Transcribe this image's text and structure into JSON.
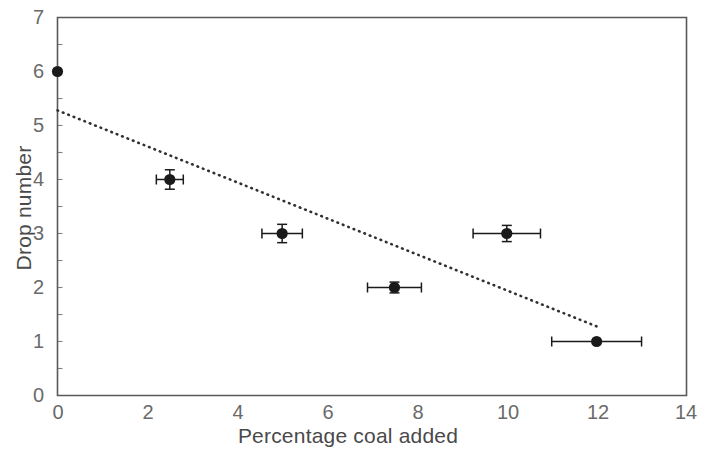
{
  "chart_data": {
    "type": "scatter",
    "title": "",
    "xlabel": "Percentage coal added",
    "ylabel": "Drop number",
    "xlim": [
      0,
      14
    ],
    "ylim": [
      0,
      7
    ],
    "xticks": [
      0,
      2,
      4,
      6,
      8,
      10,
      12,
      14
    ],
    "yticks": [
      0,
      1,
      2,
      3,
      4,
      5,
      6,
      7
    ],
    "xtick_labels": [
      "0",
      "2",
      "4",
      "6",
      "8",
      "10",
      "12",
      "14"
    ],
    "ytick_labels": [
      "0",
      "1",
      "2",
      "3",
      "4",
      "5",
      "6",
      "7"
    ],
    "grid": false,
    "legend": null,
    "marker": "filled-circle",
    "marker_color": "#1a1a1a",
    "axis_color": "#595959",
    "points": [
      {
        "x": 0.0,
        "y": 6.0,
        "xerr": 0.0,
        "yerr": 0.0
      },
      {
        "x": 2.5,
        "y": 4.0,
        "xerr": 0.3,
        "yerr": 0.18
      },
      {
        "x": 5.0,
        "y": 3.0,
        "xerr": 0.45,
        "yerr": 0.17
      },
      {
        "x": 7.5,
        "y": 2.0,
        "xerr": 0.6,
        "yerr": 0.1
      },
      {
        "x": 10.0,
        "y": 3.0,
        "xerr": 0.75,
        "yerr": 0.15
      },
      {
        "x": 12.0,
        "y": 1.0,
        "xerr": 1.0,
        "yerr": 0.0
      }
    ],
    "trendline": {
      "style": "dotted",
      "color": "#303030",
      "x_start": 0.0,
      "y_start": 5.28,
      "x_end": 12.0,
      "y_end": 1.28
    }
  }
}
